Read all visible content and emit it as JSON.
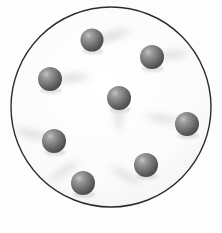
{
  "figure": {
    "width": 222,
    "height": 233,
    "background_color": "#fdfdfd"
  },
  "chart_data": {
    "type": "scatter",
    "xlabel": "",
    "ylabel": "",
    "xlim": [
      0,
      222
    ],
    "ylim": [
      0,
      233
    ],
    "grid": false,
    "legend": "none",
    "annotations": [],
    "categories": [],
    "values": [],
    "series": [
      {
        "name": "spheres",
        "marker": "sphere",
        "count": 8,
        "points": [
          {
            "label": "sphere-top",
            "x": 92,
            "y": 40,
            "r": 11.5
          },
          {
            "label": "sphere-upper-right",
            "x": 152,
            "y": 57,
            "r": 12
          },
          {
            "label": "sphere-upper-left",
            "x": 50,
            "y": 79,
            "r": 12
          },
          {
            "label": "sphere-center",
            "x": 119,
            "y": 98,
            "r": 12
          },
          {
            "label": "sphere-right",
            "x": 187,
            "y": 124,
            "r": 12
          },
          {
            "label": "sphere-left",
            "x": 54,
            "y": 141,
            "r": 12
          },
          {
            "label": "sphere-lower-right",
            "x": 146,
            "y": 165,
            "r": 12
          },
          {
            "label": "sphere-lower-left",
            "x": 83,
            "y": 183,
            "r": 12
          }
        ]
      }
    ]
  },
  "boundary": {
    "shape": "circle",
    "cx": 111,
    "cy": 107,
    "r": 100,
    "stroke_color": "#2b2b2b",
    "stroke_width": 1.4,
    "fill_color": "#fbfbfb"
  },
  "sphere_style": {
    "base_color": "#6e6e6e",
    "highlight_color": "#c2c2c2",
    "shadow_color": "#3f3f3f",
    "cast_shadow_color": "#c9c9c9"
  },
  "shadows": [
    {
      "label": "shadow-top",
      "cx": 112,
      "cy": 36,
      "rx": 26,
      "ry": 7,
      "rotate": -18,
      "opacity": 0.5
    },
    {
      "label": "shadow-upper-right",
      "cx": 172,
      "cy": 55,
      "rx": 24,
      "ry": 7,
      "rotate": -8,
      "opacity": 0.42
    },
    {
      "label": "shadow-upper-left",
      "cx": 72,
      "cy": 78,
      "rx": 26,
      "ry": 7,
      "rotate": -6,
      "opacity": 0.45
    },
    {
      "label": "shadow-center",
      "cx": 119,
      "cy": 116,
      "rx": 7,
      "ry": 22,
      "rotate": 0,
      "opacity": 0.4
    },
    {
      "label": "shadow-right",
      "cx": 163,
      "cy": 119,
      "rx": 26,
      "ry": 7,
      "rotate": 10,
      "opacity": 0.4
    },
    {
      "label": "shadow-left",
      "cx": 32,
      "cy": 134,
      "rx": 26,
      "ry": 7,
      "rotate": 12,
      "opacity": 0.45
    },
    {
      "label": "shadow-lower-right",
      "cx": 126,
      "cy": 176,
      "rx": 24,
      "ry": 7,
      "rotate": 30,
      "opacity": 0.4
    },
    {
      "label": "shadow-lower-left",
      "cx": 64,
      "cy": 171,
      "rx": 24,
      "ry": 7,
      "rotate": -34,
      "opacity": 0.4
    }
  ]
}
